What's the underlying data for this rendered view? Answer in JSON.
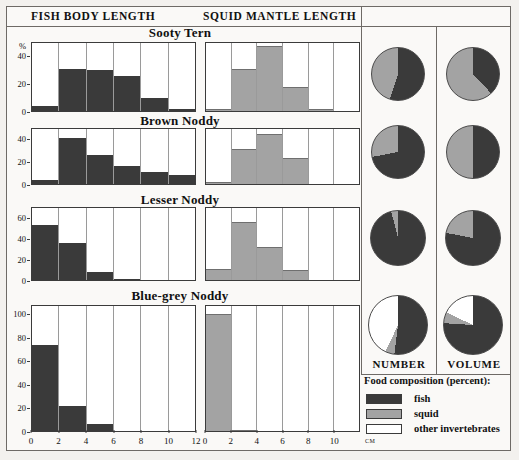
{
  "header": {
    "fish_axis_title": "FISH BODY LENGTH",
    "squid_axis_title": "SQUID MANTLE LENGTH"
  },
  "pie_columns": {
    "number_label": "NUMBER",
    "volume_label": "VOLUME"
  },
  "legend": {
    "title": "Food composition (percent):",
    "items": [
      {
        "label": "fish",
        "color": "#3a3a3a"
      },
      {
        "label": "squid",
        "color": "#a3a3a3"
      },
      {
        "label": "other invertebrates",
        "color": "#ffffff"
      }
    ]
  },
  "axes": {
    "y_unit": "%",
    "x_unit": "cm",
    "fish_x_ticks": [
      "0",
      "2",
      "4",
      "6",
      "8",
      "10",
      "12"
    ],
    "squid_x_ticks": [
      "0",
      "2",
      "4",
      "6",
      "8",
      "10"
    ],
    "fish_xlim": [
      0,
      12
    ],
    "squid_xlim": [
      0,
      12
    ]
  },
  "species": [
    {
      "name": "Sooty Tern",
      "y_ticks": [
        "0",
        "20",
        "40"
      ],
      "ylim": [
        0,
        50
      ],
      "fish_values": [
        4,
        31,
        30,
        26,
        10,
        2
      ],
      "squid_values": [
        2,
        31,
        47,
        18,
        2,
        0
      ],
      "number_pie": {
        "fish": 55,
        "squid": 45,
        "other": 0
      },
      "volume_pie": {
        "fish": 38,
        "squid": 62,
        "other": 0
      }
    },
    {
      "name": "Brown Noddy",
      "y_ticks": [
        "0",
        "20",
        "40"
      ],
      "ylim": [
        0,
        50
      ],
      "fish_values": [
        4,
        41,
        26,
        17,
        11,
        9
      ],
      "squid_values": [
        3,
        32,
        45,
        24,
        0,
        0
      ],
      "number_pie": {
        "fish": 72,
        "squid": 28,
        "other": 0
      },
      "volume_pie": {
        "fish": 50,
        "squid": 50,
        "other": 0
      }
    },
    {
      "name": "Lesser Noddy",
      "y_ticks": [
        "0",
        "20",
        "40",
        "60"
      ],
      "ylim": [
        0,
        70
      ],
      "fish_values": [
        53,
        36,
        9,
        2,
        0,
        0
      ],
      "squid_values": [
        11,
        56,
        32,
        10,
        0,
        0
      ],
      "number_pie": {
        "fish": 96,
        "squid": 4,
        "other": 0
      },
      "volume_pie": {
        "fish": 78,
        "squid": 22,
        "other": 0
      }
    },
    {
      "name": "Blue-grey Noddy",
      "y_ticks": [
        "0",
        "20",
        "40",
        "60",
        "80",
        "100"
      ],
      "ylim": [
        0,
        108
      ],
      "fish_values": [
        74,
        22,
        7,
        1,
        0,
        0
      ],
      "squid_values": [
        100,
        2,
        0,
        0,
        0,
        0
      ],
      "number_pie": {
        "fish": 52,
        "squid": 5,
        "other": 43
      },
      "volume_pie": {
        "fish": 76,
        "squid": 6,
        "other": 18
      }
    }
  ],
  "chart_data": {
    "type": "bar",
    "xlabel": "cm",
    "ylabel": "%",
    "grid": false,
    "legend_position": "bottom-right",
    "panels": [
      {
        "panel": "FISH BODY LENGTH",
        "xlabel": "cm",
        "xlim": [
          0,
          12
        ],
        "categories": [
          "0-2",
          "2-4",
          "4-6",
          "6-8",
          "8-10",
          "10-12"
        ],
        "series": [
          {
            "name": "Sooty Tern",
            "values": [
              4,
              31,
              30,
              26,
              10,
              2
            ],
            "ylim": [
              0,
              50
            ]
          },
          {
            "name": "Brown Noddy",
            "values": [
              4,
              41,
              26,
              17,
              11,
              9
            ],
            "ylim": [
              0,
              50
            ]
          },
          {
            "name": "Lesser Noddy",
            "values": [
              53,
              36,
              9,
              2,
              0,
              0
            ],
            "ylim": [
              0,
              70
            ]
          },
          {
            "name": "Blue-grey Noddy",
            "values": [
              74,
              22,
              7,
              1,
              0,
              0
            ],
            "ylim": [
              0,
              108
            ]
          }
        ]
      },
      {
        "panel": "SQUID MANTLE LENGTH",
        "xlabel": "cm",
        "xlim": [
          0,
          12
        ],
        "categories": [
          "0-2",
          "2-4",
          "4-6",
          "6-8",
          "8-10",
          "10-12"
        ],
        "series": [
          {
            "name": "Sooty Tern",
            "values": [
              2,
              31,
              47,
              18,
              2,
              0
            ],
            "ylim": [
              0,
              50
            ]
          },
          {
            "name": "Brown Noddy",
            "values": [
              3,
              32,
              45,
              24,
              0,
              0
            ],
            "ylim": [
              0,
              50
            ]
          },
          {
            "name": "Lesser Noddy",
            "values": [
              11,
              56,
              32,
              10,
              0,
              0
            ],
            "ylim": [
              0,
              70
            ]
          },
          {
            "name": "Blue-grey Noddy",
            "values": [
              100,
              2,
              0,
              0,
              0,
              0
            ],
            "ylim": [
              0,
              108
            ]
          }
        ]
      },
      {
        "panel": "NUMBER",
        "type": "pie",
        "slices": [
          "fish",
          "squid",
          "other invertebrates"
        ],
        "series": [
          {
            "name": "Sooty Tern",
            "values": [
              55,
              45,
              0
            ]
          },
          {
            "name": "Brown Noddy",
            "values": [
              72,
              28,
              0
            ]
          },
          {
            "name": "Lesser Noddy",
            "values": [
              96,
              4,
              0
            ]
          },
          {
            "name": "Blue-grey Noddy",
            "values": [
              52,
              5,
              43
            ]
          }
        ]
      },
      {
        "panel": "VOLUME",
        "type": "pie",
        "slices": [
          "fish",
          "squid",
          "other invertebrates"
        ],
        "series": [
          {
            "name": "Sooty Tern",
            "values": [
              38,
              62,
              0
            ]
          },
          {
            "name": "Brown Noddy",
            "values": [
              50,
              50,
              0
            ]
          },
          {
            "name": "Lesser Noddy",
            "values": [
              78,
              22,
              0
            ]
          },
          {
            "name": "Blue-grey Noddy",
            "values": [
              76,
              6,
              18
            ]
          }
        ]
      }
    ]
  }
}
